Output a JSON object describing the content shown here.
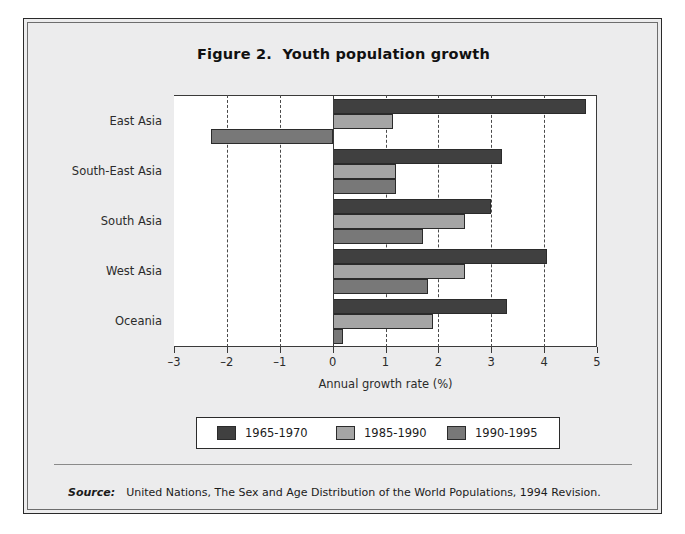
{
  "figure": {
    "title": "Figure 2.  Youth population growth",
    "source_label": "Source:",
    "source_text": "United Nations, The Sex and Age Distribution of the World Populations, 1994 Revision."
  },
  "chart_data": {
    "type": "bar",
    "orientation": "horizontal",
    "title": "Figure 2.  Youth population growth",
    "xlabel": "Annual growth rate (%)",
    "ylabel": "",
    "xlim": [
      -3,
      5
    ],
    "xticks": [
      -3,
      -2,
      -1,
      0,
      1,
      2,
      3,
      4,
      5
    ],
    "xtick_labels": [
      "–3",
      "–2",
      "–1",
      "0",
      "1",
      "2",
      "3",
      "4",
      "5"
    ],
    "grid": "vertical-dashed",
    "legend_position": "below-axis",
    "categories": [
      "East Asia",
      "South-East Asia",
      "South Asia",
      "West Asia",
      "Oceania"
    ],
    "series": [
      {
        "name": "1965-1970",
        "color": "#404040",
        "values": [
          4.8,
          3.2,
          3.0,
          4.05,
          3.3
        ]
      },
      {
        "name": "1985-1990",
        "color": "#a5a5a5",
        "values": [
          1.15,
          1.2,
          2.5,
          2.5,
          1.9
        ]
      },
      {
        "name": "1990-1995",
        "color": "#787878",
        "values": [
          -2.3,
          1.2,
          1.7,
          1.8,
          0.2
        ]
      }
    ]
  },
  "colors": {
    "series_1965_1970": "#404040",
    "series_1985_1990": "#a5a5a5",
    "series_1990_1995": "#787878",
    "frame": "#2a2a2a",
    "panel_background": "#ececed",
    "plot_background": "#ffffff"
  }
}
